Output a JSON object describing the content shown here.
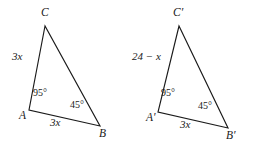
{
  "figure": {
    "background_color": "#ffffff",
    "stroke_color": "#1a1a1a",
    "triangles": [
      {
        "name": "triangle-abc",
        "vertices": {
          "C": "C",
          "A": "A",
          "B": "B"
        },
        "angles": {
          "A": "95°",
          "B": "45°"
        },
        "sides": {
          "AC": "3x",
          "AB": "3x"
        }
      },
      {
        "name": "triangle-abc-prime",
        "vertices": {
          "C": "C′",
          "A": "A′",
          "B": "B′"
        },
        "angles": {
          "A": "95°",
          "B": "45°"
        },
        "sides": {
          "AC": "24 − x",
          "AB": "3x"
        }
      }
    ]
  }
}
